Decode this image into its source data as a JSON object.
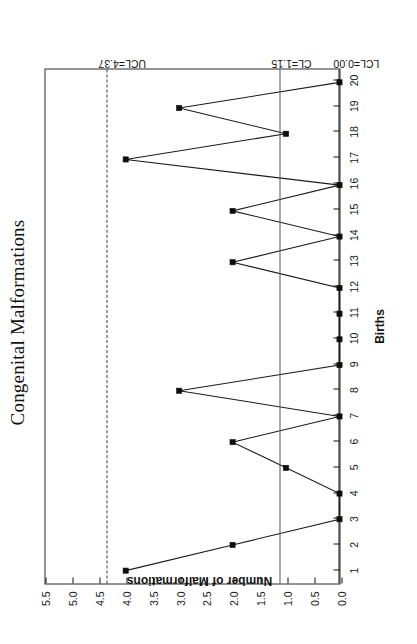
{
  "chart_data": {
    "type": "line",
    "title": "Congenital Malformations",
    "xlabel": "Births",
    "ylabel": "Number of Malformations",
    "x": [
      1,
      2,
      3,
      4,
      5,
      6,
      7,
      8,
      9,
      10,
      11,
      12,
      13,
      14,
      15,
      16,
      17,
      18,
      19,
      20
    ],
    "values": [
      4,
      2,
      0,
      0,
      1,
      2,
      0,
      3,
      0,
      0,
      0,
      0,
      2,
      0,
      2,
      0,
      4,
      1,
      3,
      0
    ],
    "series": [
      {
        "name": "Number of Malformations",
        "values": [
          4,
          2,
          0,
          0,
          1,
          2,
          0,
          3,
          0,
          0,
          0,
          0,
          2,
          0,
          2,
          0,
          4,
          1,
          3,
          0
        ]
      }
    ],
    "xlim": [
      0.5,
      20.5
    ],
    "ylim": [
      0.0,
      5.5
    ],
    "ytick_labels": [
      "0.0",
      "0.5",
      "1.0",
      "1.5",
      "2.0",
      "2.5",
      "3.0",
      "3.5",
      "4.0",
      "4.5",
      "5.0",
      "5.5"
    ],
    "ytick_values": [
      0.0,
      0.5,
      1.0,
      1.5,
      2.0,
      2.5,
      3.0,
      3.5,
      4.0,
      4.5,
      5.0,
      5.5
    ],
    "xtick_labels": [
      "1",
      "2",
      "3",
      "4",
      "5",
      "6",
      "7",
      "8",
      "9",
      "10",
      "11",
      "12",
      "13",
      "14",
      "15",
      "16",
      "17",
      "18",
      "19",
      "20"
    ],
    "grid": false,
    "legend": "none",
    "marker": "filled-square",
    "control_limits": [
      {
        "key": "ucl",
        "label": "UCL=4.37",
        "value": 4.37,
        "style": "dashed"
      },
      {
        "key": "cl",
        "label": "CL=1.15",
        "value": 1.15,
        "style": "solid"
      },
      {
        "key": "lcl",
        "label": "LCL=0.00",
        "value": 0.0,
        "style": "axis"
      }
    ],
    "colors": {
      "line": "#1b1b1b",
      "marker": "#0d0d0d",
      "ucl": "#3a3a3a",
      "cl": "#555555",
      "axis": "#111111",
      "background": "#fefefe"
    },
    "page_orientation": "chart rotated 90 degrees counter-clockwise on the page"
  }
}
